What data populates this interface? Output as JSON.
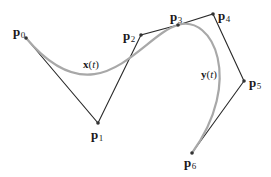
{
  "diagram": {
    "type": "bezier-control-polygon",
    "colors": {
      "polygon": "#2a2a2a",
      "curve": "#a8a8a8",
      "points": "#333333",
      "background": "#ffffff"
    },
    "points": [
      {
        "id": "p0",
        "base": "p",
        "sub": "0",
        "x": 26,
        "y": 38
      },
      {
        "id": "p1",
        "base": "p",
        "sub": "1",
        "x": 98,
        "y": 123
      },
      {
        "id": "p2",
        "base": "p",
        "sub": "2",
        "x": 141,
        "y": 35
      },
      {
        "id": "p3",
        "base": "p",
        "sub": "3",
        "x": 178,
        "y": 25
      },
      {
        "id": "p4",
        "base": "p",
        "sub": "4",
        "x": 213,
        "y": 14
      },
      {
        "id": "p5",
        "base": "p",
        "sub": "5",
        "x": 244,
        "y": 81
      },
      {
        "id": "p6",
        "base": "p",
        "sub": "6",
        "x": 192,
        "y": 153
      }
    ],
    "curves": [
      {
        "id": "x",
        "name": "x",
        "param": "t",
        "label": "x(t)",
        "control_points": [
          "p0",
          "p1",
          "p2",
          "p3"
        ]
      },
      {
        "id": "y",
        "name": "y",
        "param": "t",
        "label": "y(t)",
        "control_points": [
          "p3",
          "p4",
          "p5",
          "p6"
        ]
      }
    ]
  }
}
